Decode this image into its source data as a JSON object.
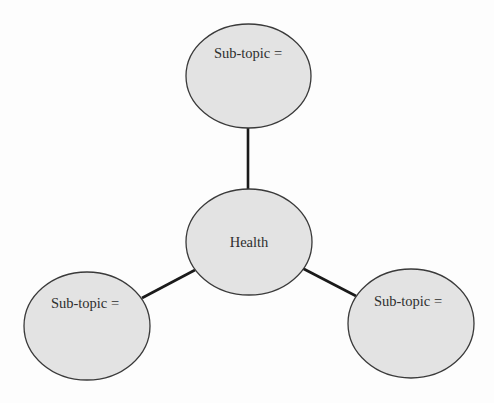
{
  "diagram": {
    "type": "mind-map",
    "colors": {
      "node_fill": "#e3e3e3",
      "node_stroke": "#3a3a3a",
      "connector": "#1a1a1a",
      "text": "#2e2e2e",
      "background": "#fdfdfd"
    },
    "center": {
      "label": "Health"
    },
    "subtopics": [
      {
        "position": "top",
        "label": "Sub-topic ="
      },
      {
        "position": "bottom-left",
        "label": "Sub-topic ="
      },
      {
        "position": "bottom-right",
        "label": "Sub-topic ="
      }
    ],
    "edges": [
      {
        "from": "Health",
        "to": "top"
      },
      {
        "from": "Health",
        "to": "bottom-left"
      },
      {
        "from": "Health",
        "to": "bottom-right"
      }
    ]
  }
}
